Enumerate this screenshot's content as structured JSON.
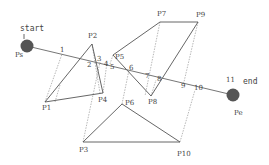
{
  "diagram": {
    "start": {
      "label": "start",
      "point_label": "Ps",
      "x": 27,
      "y": 46,
      "r": 6,
      "color": "#555555"
    },
    "end": {
      "label": "end",
      "point_label": "Pe",
      "x": 233,
      "y": 95,
      "r": 6,
      "color": "#555555"
    },
    "obstacles": [
      {
        "name": "triangle-1",
        "vertices": [
          "P1",
          "P2",
          "P4"
        ]
      },
      {
        "name": "quad-2",
        "vertices": [
          "P5",
          "P7",
          "P9",
          "P8"
        ]
      },
      {
        "name": "triangle-3",
        "vertices": [
          "P3",
          "P6",
          "P10"
        ]
      }
    ],
    "points": {
      "P1": {
        "label": "P1",
        "x": 45,
        "y": 102
      },
      "P2": {
        "label": "P2",
        "x": 92,
        "y": 44
      },
      "P3": {
        "label": "P3",
        "x": 83,
        "y": 142
      },
      "P4": {
        "label": "P4",
        "x": 103,
        "y": 93
      },
      "P5": {
        "label": "P5",
        "x": 113,
        "y": 55
      },
      "P6": {
        "label": "P6",
        "x": 122,
        "y": 104
      },
      "P7": {
        "label": "P7",
        "x": 160,
        "y": 22
      },
      "P8": {
        "label": "P8",
        "x": 151,
        "y": 96
      },
      "P9": {
        "label": "P9",
        "x": 198,
        "y": 22
      },
      "P10": {
        "label": "P10",
        "x": 180,
        "y": 142
      }
    },
    "intersections": [
      "1",
      "2",
      "3",
      "4",
      "5",
      "6",
      "7",
      "8",
      "9",
      "10",
      "11"
    ]
  }
}
